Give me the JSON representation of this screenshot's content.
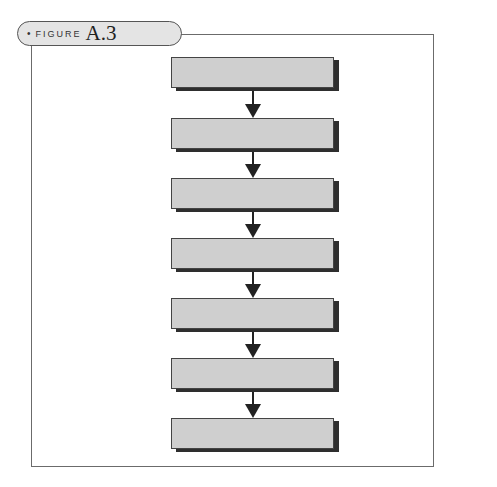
{
  "figure": {
    "bullet": "•",
    "label": "FIGURE",
    "number": "A.3"
  },
  "diagram": {
    "type": "vertical-flowchart",
    "box_count": 7,
    "boxes": [
      {
        "label": ""
      },
      {
        "label": ""
      },
      {
        "label": ""
      },
      {
        "label": ""
      },
      {
        "label": ""
      },
      {
        "label": ""
      },
      {
        "label": ""
      }
    ],
    "arrow_count": 6,
    "colors": {
      "box_fill": "#cfcfcf",
      "box_border": "#444444",
      "box_shadow": "#2e2e2e",
      "arrow": "#222222",
      "header_fill": "#e4e4e4"
    }
  }
}
